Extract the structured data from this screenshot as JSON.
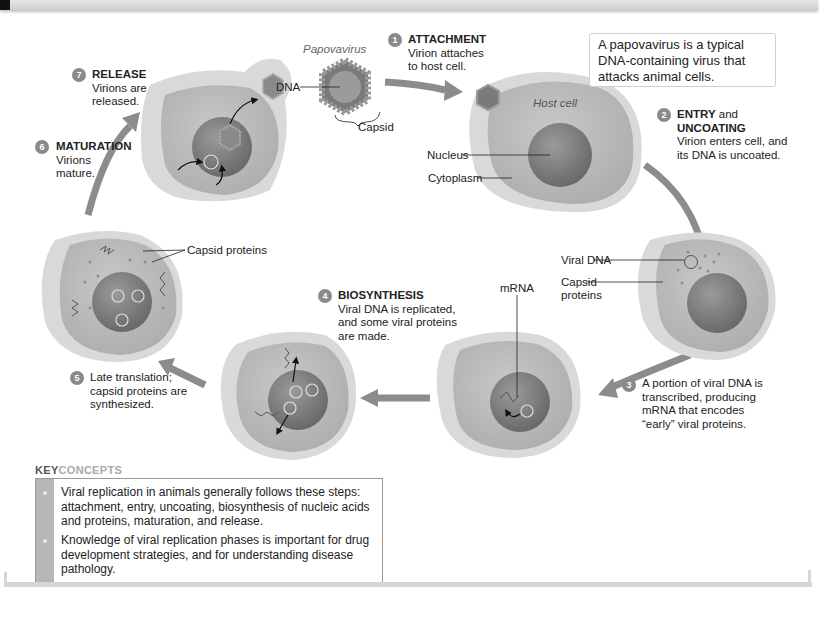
{
  "header": {
    "bar": "top-rule"
  },
  "virus": {
    "name": "Papovavirus",
    "labels": {
      "dna": "DNA",
      "capsid": "Capsid"
    }
  },
  "callout": {
    "text": "A papovavirus is a typical DNA-containing virus that attacks animal cells."
  },
  "host_cell": {
    "name": "Host cell",
    "labels": {
      "nucleus": "Nucleus",
      "cytoplasm": "Cytoplasm"
    }
  },
  "steps": [
    {
      "number": "1",
      "title": "ATTACHMENT",
      "title_suffix": "",
      "lines": [
        "Virion attaches",
        "to host cell."
      ]
    },
    {
      "number": "2",
      "title": "ENTRY",
      "title_suffix": " and",
      "title2": "UNCOATING",
      "lines": [
        "Virion enters cell, and",
        "its DNA is uncoated."
      ]
    },
    {
      "number": "3",
      "title": "",
      "lines": [
        "A portion of viral DNA is",
        "transcribed, producing",
        "mRNA that encodes",
        "“early” viral proteins."
      ]
    },
    {
      "number": "4",
      "title": "BIOSYNTHESIS",
      "lines": [
        "Viral DNA is replicated,",
        "and some viral proteins",
        "are made."
      ]
    },
    {
      "number": "5",
      "title": "",
      "lines": [
        "Late translation;",
        "capsid proteins are",
        "synthesized."
      ]
    },
    {
      "number": "6",
      "title": "MATURATION",
      "lines": [
        "Virions",
        "mature."
      ]
    },
    {
      "number": "7",
      "title": "RELEASE",
      "lines": [
        "Virions are",
        "released."
      ]
    }
  ],
  "cell_labels": {
    "viral_dna": "Viral DNA",
    "capsid_proteins_1": "Capsid",
    "capsid_proteins_2": "proteins",
    "mrna": "mRNA",
    "capsid_proteins_late": "Capsid proteins"
  },
  "key_concepts": {
    "heading_bold": "KEY",
    "heading_light": "CONCEPTS",
    "items": [
      {
        "lines": [
          "Viral replication in animals generally follows these steps:",
          "attachment, entry, uncoating, biosynthesis of nucleic acids",
          "and proteins, maturation, and release."
        ]
      },
      {
        "lines": [
          "Knowledge of viral replication phases is important for drug",
          "development strategies, and for understanding disease",
          "pathology."
        ]
      }
    ]
  },
  "colors": {
    "cell_outer": "#d9d9d9",
    "cell_cytoplasm": "#bdbdbd",
    "nucleus": "#7d7d7d",
    "arrow": "#8c8c8c",
    "step_badge": "#8a8a8a",
    "kc_bar": "#b7b7b7"
  }
}
